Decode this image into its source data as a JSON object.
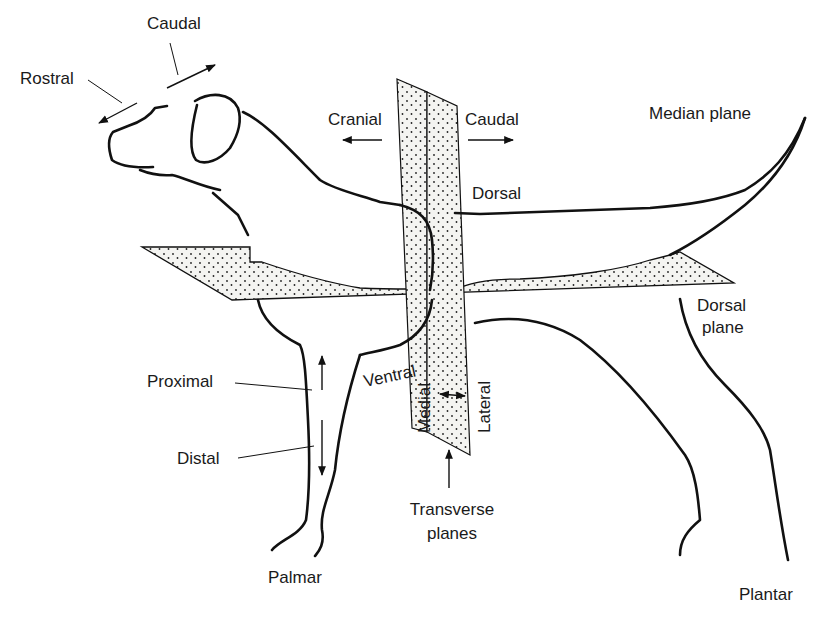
{
  "diagram": {
    "colors": {
      "line": "#111111",
      "plane_fill": "#f4f4f1",
      "dots": "#222222",
      "background": "#ffffff"
    },
    "labels": {
      "caudal_head": "Caudal",
      "rostral": "Rostral",
      "cranial": "Cranial",
      "caudal_body": "Caudal",
      "median_plane": "Median plane",
      "dorsal": "Dorsal",
      "dorsal_plane_line1": "Dorsal",
      "dorsal_plane_line2": "plane",
      "proximal": "Proximal",
      "distal": "Distal",
      "ventral": "Ventral",
      "medial": "Medial",
      "lateral": "Lateral",
      "transverse_line1": "Transverse",
      "transverse_line2": "planes",
      "palmar": "Palmar",
      "plantar": "Plantar"
    }
  }
}
